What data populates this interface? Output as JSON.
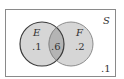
{
  "diagram": {
    "type": "venn",
    "universe_label": "S",
    "sets": [
      {
        "name": "E",
        "only_value": ".1"
      },
      {
        "name": "F",
        "only_value": ".2"
      }
    ],
    "intersection_value": ".6",
    "outside_value": ".1",
    "colors": {
      "border": "#8a8a8a",
      "circle_fill": "#d6d6d6",
      "intersection_fill": "#b4b4b4",
      "e_outline": "#3a3a3a",
      "f_outline": "#8c8c8c"
    }
  }
}
